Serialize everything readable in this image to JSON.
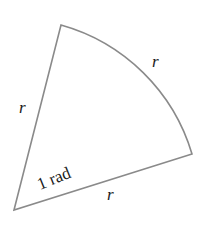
{
  "diagram": {
    "labels": {
      "left_radius": "r",
      "arc_length": "r",
      "bottom_radius": "r",
      "angle": "1 rad"
    },
    "colors": {
      "stroke": "#8a8a8a",
      "text": "#1a1a1a",
      "background": "#ffffff"
    }
  }
}
